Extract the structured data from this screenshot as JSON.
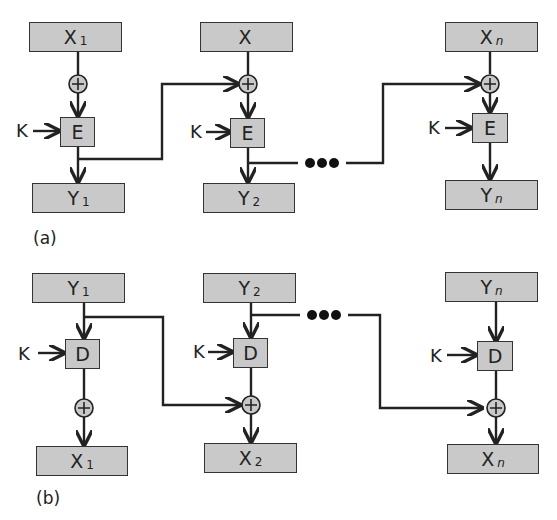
{
  "diagram": {
    "part_a": {
      "caption": "(a)",
      "inputs": [
        {
          "main": "X",
          "sub": "1"
        },
        {
          "main": "X",
          "sub": ""
        },
        {
          "main": "X",
          "sub": "n"
        }
      ],
      "blocks": [
        "E",
        "E",
        "E"
      ],
      "outputs": [
        {
          "main": "Y",
          "sub": "1"
        },
        {
          "main": "Y",
          "sub": "2"
        },
        {
          "main": "Y",
          "sub": "n"
        }
      ],
      "key_label": "K",
      "xor_symbol": "+",
      "ellipsis": "•••"
    },
    "part_b": {
      "caption": "(b)",
      "inputs": [
        {
          "main": "Y",
          "sub": "1"
        },
        {
          "main": "Y",
          "sub": "2"
        },
        {
          "main": "Y",
          "sub": "n"
        }
      ],
      "blocks": [
        "D",
        "D",
        "D"
      ],
      "outputs": [
        {
          "main": "X",
          "sub": "1"
        },
        {
          "main": "X",
          "sub": "2"
        },
        {
          "main": "X",
          "sub": "n"
        }
      ],
      "key_label": "K",
      "xor_symbol": "+",
      "ellipsis": "•••"
    },
    "colors": {
      "box_fill": "#c9c9c9",
      "line": "#222222"
    }
  }
}
